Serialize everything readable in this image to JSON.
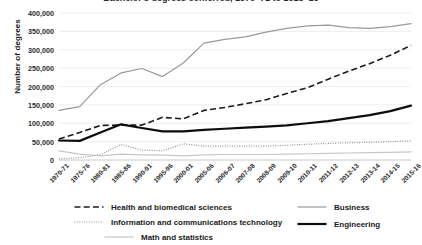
{
  "chart_data": {
    "type": "line",
    "title": "Bachelor's degrees conferred, 1970–71 to 2015–16",
    "xlabel": "",
    "ylabel": "Number of degrees",
    "ylim": [
      0,
      400000
    ],
    "ytick_values": [
      0,
      50000,
      100000,
      150000,
      200000,
      250000,
      300000,
      350000,
      400000
    ],
    "ytick_labels": [
      "0",
      "50,000",
      "100,000",
      "150,000",
      "200,000",
      "250,000",
      "300,000",
      "350,000",
      "400,000"
    ],
    "grid": true,
    "legend_position": "bottom",
    "categories": [
      "1970-71",
      "1975-76",
      "1980-81",
      "1985-86",
      "1990-91",
      "1995-96",
      "2000-01",
      "2005-06",
      "2006-07",
      "2007-08",
      "2008-09",
      "2009-10",
      "2010-11",
      "2011-12",
      "2012-13",
      "2013-14",
      "2014-15",
      "2015-16"
    ],
    "series": [
      {
        "name": "Business",
        "style": "solid-gray",
        "color": "#9a9a9a",
        "values": [
          135000,
          145000,
          205000,
          237000,
          249000,
          227000,
          264000,
          318000,
          328000,
          335000,
          348000,
          358000,
          365000,
          367000,
          360000,
          358000,
          363000,
          371000
        ]
      },
      {
        "name": "Health and biomedical sciences",
        "style": "dashed-black",
        "color": "#1a1a1a",
        "values": [
          57000,
          75000,
          94000,
          95000,
          95000,
          116000,
          112000,
          135000,
          143000,
          153000,
          164000,
          181000,
          197000,
          220000,
          242000,
          262000,
          285000,
          312000
        ]
      },
      {
        "name": "Engineering",
        "style": "solid-black-thick",
        "color": "#0d0d0d",
        "values": [
          53000,
          52000,
          75000,
          97000,
          87000,
          78000,
          78000,
          82000,
          85000,
          88000,
          91000,
          94000,
          100000,
          106000,
          114000,
          122000,
          133000,
          148000
        ]
      },
      {
        "name": "Information and communications technology",
        "style": "dotted-gray",
        "color": "#8c8c8c",
        "values": [
          3000,
          6000,
          15000,
          42000,
          27000,
          25000,
          44000,
          38000,
          38000,
          38000,
          38000,
          40000,
          43000,
          45000,
          47000,
          48000,
          50000,
          52000
        ]
      },
      {
        "name": "Math and statistics",
        "style": "solid-lightgray",
        "color": "#c7c7c7",
        "values": [
          25000,
          16000,
          11000,
          16000,
          14000,
          13000,
          11000,
          14000,
          15000,
          15000,
          15000,
          16000,
          17000,
          18000,
          19000,
          20000,
          21000,
          22000
        ]
      }
    ]
  },
  "legend": {
    "left_items": [
      {
        "label": "Health and biomedical sciences",
        "swatch": "dashed-black"
      },
      {
        "label": "Information and communications technology",
        "swatch": "dotted-gray"
      },
      {
        "label": "Math and statistics",
        "swatch": "solid-lightgray"
      }
    ],
    "right_items": [
      {
        "label": "Business",
        "swatch": "solid-gray"
      },
      {
        "label": "Engineering",
        "swatch": "solid-black-thick"
      }
    ]
  }
}
